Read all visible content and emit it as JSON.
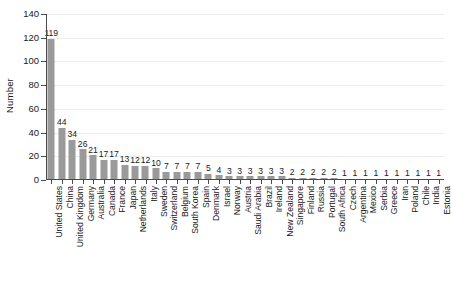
{
  "chart_data": {
    "type": "bar",
    "title": "",
    "subtitle": "",
    "xlabel": "",
    "ylabel": "Number",
    "ylim": [
      0,
      140
    ],
    "yticks": [
      0,
      20,
      40,
      60,
      80,
      100,
      120,
      140
    ],
    "ytick_labels": [
      "0",
      "20",
      "40",
      "60",
      "80",
      "100",
      "120",
      "140"
    ],
    "grid": "horizontal",
    "legend": "none",
    "bar_color": "#9a9a9a",
    "value_labels_shown": true,
    "categories": [
      "United States",
      "China",
      "United Kingdom",
      "Germany",
      "Australia",
      "Canada",
      "France",
      "Japan",
      "Netherlands",
      "Italy",
      "Sweden",
      "Switzerland",
      "Belgium",
      "South Korea",
      "Spain",
      "Denmark",
      "Israel",
      "Norway",
      "Austria",
      "Saudi Arabia",
      "Brazil",
      "Ireland",
      "New Zealand",
      "Singapore",
      "Finland",
      "Russia",
      "Portugal",
      "South Africa",
      "Czech",
      "Argentina",
      "Mexico",
      "Serbia",
      "Greece",
      "Iran",
      "Poland",
      "Chile",
      "India",
      "Estonia"
    ],
    "values": [
      119,
      44,
      34,
      26,
      21,
      17,
      17,
      13,
      12,
      12,
      10,
      7,
      7,
      7,
      7,
      5,
      4,
      3,
      3,
      3,
      3,
      3,
      3,
      2,
      2,
      2,
      2,
      2,
      1,
      1,
      1,
      1,
      1,
      1,
      1,
      1,
      1,
      1
    ]
  }
}
